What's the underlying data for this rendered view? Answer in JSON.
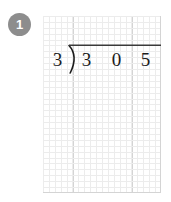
{
  "problem": {
    "badge_number": "1",
    "badge_color": "#8d8d8d",
    "badge_text_color": "#ffffff"
  },
  "math": {
    "type": "long-division",
    "divisor": "3",
    "dividend": "305",
    "dividend_digits": [
      "3",
      "0",
      "5"
    ],
    "quotient": "",
    "ink_color": "#1b1b1b"
  },
  "grid": {
    "columns": 4,
    "rows": 6,
    "cell_size_px": 29.5,
    "major_line_color": "#d4d4d4",
    "minor_line_color": "#ececec",
    "paper_color": "#ffffff"
  }
}
